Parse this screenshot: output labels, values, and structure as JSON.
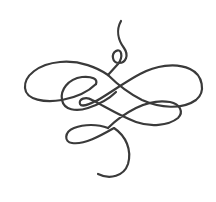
{
  "image": {
    "description": "Decorative calligraphic flourish ornament",
    "background": "#ffffff",
    "stroke_color": "#3a3a3a",
    "stroke_width": 2.2
  }
}
